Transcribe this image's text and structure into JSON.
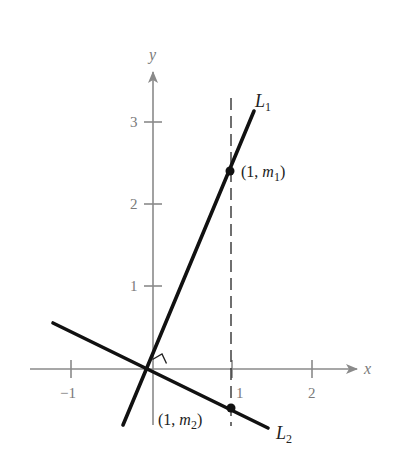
{
  "figure": {
    "type": "coordinate-diagram",
    "axes": {
      "x_label": "x",
      "y_label": "y",
      "x_ticks": [
        {
          "value": -1,
          "label": "−1"
        },
        {
          "value": 1,
          "label": "1"
        },
        {
          "value": 2,
          "label": "2"
        }
      ],
      "y_ticks": [
        {
          "value": 1,
          "label": "1"
        },
        {
          "value": 2,
          "label": "2"
        },
        {
          "value": 3,
          "label": "3"
        }
      ]
    },
    "lines": [
      {
        "name": "L1",
        "label_main": "L",
        "label_sub": "1",
        "slope_sign": "positive"
      },
      {
        "name": "L2",
        "label_main": "L",
        "label_sub": "2",
        "slope_sign": "negative"
      }
    ],
    "points": [
      {
        "label_prefix": "(1, ",
        "label_var": "m",
        "label_sub": "1",
        "label_suffix": ")",
        "x": 1,
        "y": "m1"
      },
      {
        "label_prefix": "(1, ",
        "label_var": "m",
        "label_sub": "2",
        "label_suffix": ")",
        "x": 1,
        "y": "m2"
      }
    ],
    "annotations": {
      "right_angle_marker": "perpendicular at intersection",
      "dashed_vertical_line": "x = 1"
    },
    "colors": {
      "axis": "#8a8a8a",
      "line": "#111111",
      "background": "#ffffff"
    }
  }
}
